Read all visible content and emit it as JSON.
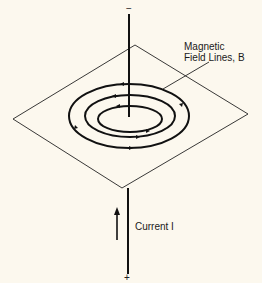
{
  "diagram": {
    "polarity_top": "−",
    "polarity_bottom": "+",
    "field_label_line1": "Magnetic",
    "field_label_line2": "Field Lines, B",
    "current_label": "Current I",
    "field_direction": "counterclockwise (viewed from above)",
    "current_direction": "up",
    "field_line_count": 3,
    "colors": {
      "background": "#fcf8ee",
      "ink": "#111111"
    }
  }
}
